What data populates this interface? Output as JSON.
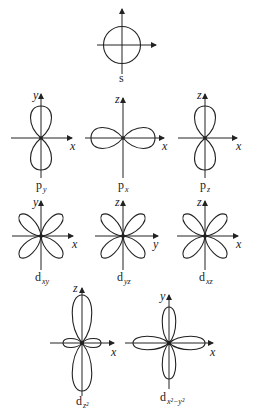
{
  "orbitals": {
    "s": {
      "label": "s"
    },
    "py": {
      "label": "p",
      "sub": "y",
      "axes": {
        "horizontal": "x",
        "vertical": "y"
      }
    },
    "px": {
      "label": "p",
      "sub": "x",
      "axes": {
        "horizontal": "x",
        "vertical": "z"
      }
    },
    "pz": {
      "label": "p",
      "sub": "z",
      "axes": {
        "horizontal": "x",
        "vertical": "z"
      }
    },
    "dxy": {
      "label": "d",
      "sub": "xy",
      "axes": {
        "horizontal": "x",
        "vertical": "y"
      }
    },
    "dyz": {
      "label": "d",
      "sub": "yz",
      "axes": {
        "horizontal": "y",
        "vertical": "z"
      }
    },
    "dxz": {
      "label": "d",
      "sub": "xz",
      "axes": {
        "horizontal": "x",
        "vertical": "z"
      }
    },
    "dz2": {
      "label": "d",
      "sub": "z²",
      "axes": {
        "horizontal": "x",
        "vertical": "z"
      }
    },
    "dx2y2": {
      "label": "d",
      "sub": "x²−y²",
      "axes": {
        "horizontal": "x",
        "vertical": "y"
      }
    }
  },
  "colors": {
    "line": "#222222",
    "background": "#ffffff"
  }
}
